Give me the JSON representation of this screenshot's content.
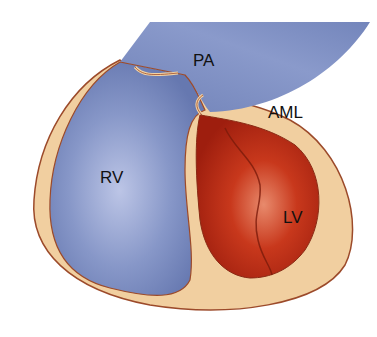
{
  "diagram": {
    "type": "cardiac anatomy cross-section",
    "labels": {
      "pa": "PA",
      "aml": "AML",
      "rv": "RV",
      "lv": "LV"
    },
    "colors": {
      "background": "#ffffff",
      "pericardium": "#f1cfa0",
      "outline": "#9c4a2a",
      "right_heart": "#7a8dbf",
      "right_heart_light": "#b3bde0",
      "left_ventricle": "#b52a14",
      "left_ventricle_light": "#e06a4c"
    }
  }
}
